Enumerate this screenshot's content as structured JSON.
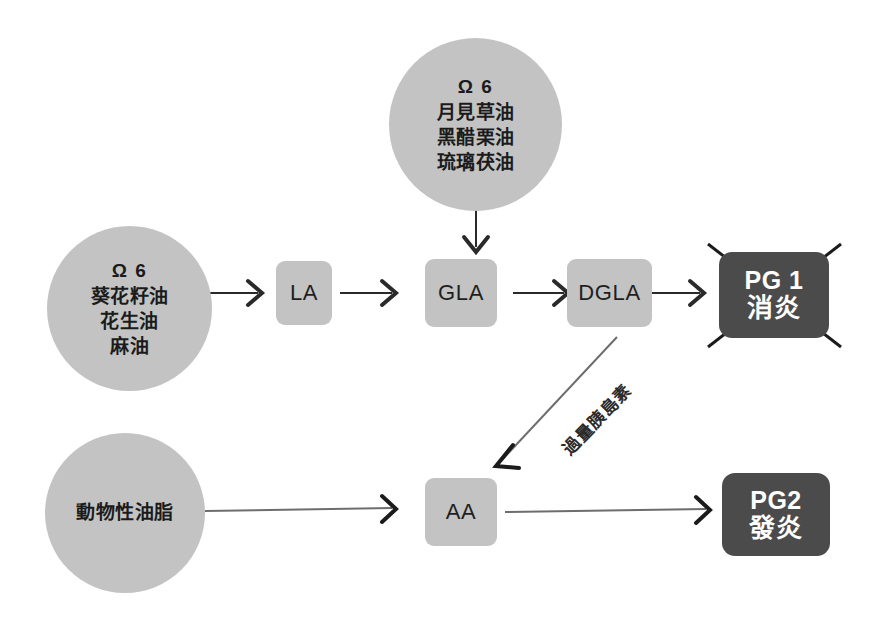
{
  "diagram": {
    "colors": {
      "circle_fill": "#c3c3c3",
      "box_fill": "#c3c3c3",
      "dark_box_fill": "#4b4b4b",
      "dark_box_text": "#ffffff",
      "arrow": "#2a2a2a",
      "background": "#ffffff",
      "cross_out": "#1b1b1b"
    },
    "nodes": {
      "source_top": {
        "shape": "circle",
        "lines": [
          "Ω 6",
          "月見草油",
          "黑醋栗油",
          "琉璃茯油"
        ]
      },
      "source_left": {
        "shape": "circle",
        "lines": [
          "Ω 6",
          "葵花籽油",
          "花生油",
          "麻油"
        ]
      },
      "source_bottom_left": {
        "shape": "circle",
        "lines": [
          "動物性油脂"
        ]
      },
      "la": {
        "shape": "box",
        "lines": [
          "LA"
        ]
      },
      "gla": {
        "shape": "box",
        "lines": [
          "GLA"
        ]
      },
      "dgla": {
        "shape": "box",
        "lines": [
          "DGLA"
        ]
      },
      "aa": {
        "shape": "box",
        "lines": [
          "AA"
        ]
      },
      "pg1": {
        "shape": "dark-box",
        "lines": [
          "PG 1",
          "消炎"
        ],
        "crossed_out": true
      },
      "pg2": {
        "shape": "dark-box",
        "lines": [
          "PG2",
          "發炎"
        ],
        "crossed_out": false
      }
    },
    "edges": [
      {
        "name": "source-left-to-la",
        "from": "source_left",
        "to": "la",
        "label": ""
      },
      {
        "name": "la-to-gla",
        "from": "la",
        "to": "gla",
        "label": ""
      },
      {
        "name": "source-top-to-gla",
        "from": "source_top",
        "to": "gla",
        "label": ""
      },
      {
        "name": "gla-to-dgla",
        "from": "gla",
        "to": "dgla",
        "label": ""
      },
      {
        "name": "dgla-to-pg1",
        "from": "dgla",
        "to": "pg1",
        "label": ""
      },
      {
        "name": "dgla-to-aa",
        "from": "dgla",
        "to": "aa",
        "label": "過量胰島素"
      },
      {
        "name": "source-bottom-left-to-aa",
        "from": "source_bottom_left",
        "to": "aa",
        "label": ""
      },
      {
        "name": "aa-to-pg2",
        "from": "aa",
        "to": "pg2",
        "label": ""
      }
    ]
  }
}
